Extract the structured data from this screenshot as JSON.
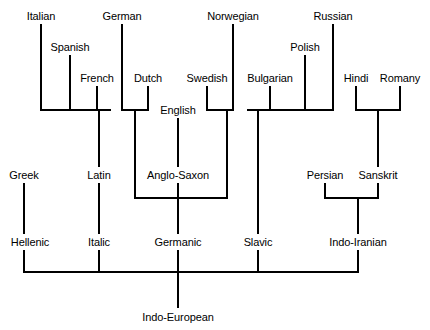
{
  "figure": {
    "background_color": "#ffffff",
    "line_color": "#000000",
    "text_color": "#000000",
    "width": 430,
    "height": 330
  },
  "nodes": [
    {
      "id": "italian",
      "label": "Italian",
      "x": 41,
      "y": 16,
      "level": "language"
    },
    {
      "id": "spanish",
      "label": "Spanish",
      "x": 70,
      "y": 47,
      "level": "language"
    },
    {
      "id": "french",
      "label": "French",
      "x": 97,
      "y": 78,
      "level": "language"
    },
    {
      "id": "german",
      "label": "German",
      "x": 122,
      "y": 16,
      "level": "language"
    },
    {
      "id": "dutch",
      "label": "Dutch",
      "x": 148,
      "y": 78,
      "level": "language"
    },
    {
      "id": "english",
      "label": "English",
      "x": 178,
      "y": 110,
      "level": "language"
    },
    {
      "id": "swedish",
      "label": "Swedish",
      "x": 207,
      "y": 78,
      "level": "language"
    },
    {
      "id": "norwegian",
      "label": "Norwegian",
      "x": 233,
      "y": 16,
      "level": "language"
    },
    {
      "id": "bulgarian",
      "label": "Bulgarian",
      "x": 270,
      "y": 78,
      "level": "language"
    },
    {
      "id": "polish",
      "label": "Polish",
      "x": 305,
      "y": 47,
      "level": "language"
    },
    {
      "id": "russian",
      "label": "Russian",
      "x": 333,
      "y": 16,
      "level": "language"
    },
    {
      "id": "hindi",
      "label": "Hindi",
      "x": 356,
      "y": 78,
      "level": "language"
    },
    {
      "id": "romany",
      "label": "Romany",
      "x": 400,
      "y": 78,
      "level": "language"
    },
    {
      "id": "greek",
      "label": "Greek",
      "x": 24,
      "y": 175,
      "level": "ancestor"
    },
    {
      "id": "latin",
      "label": "Latin",
      "x": 99,
      "y": 175,
      "level": "ancestor"
    },
    {
      "id": "anglo-saxon",
      "label": "Anglo-Saxon",
      "x": 178,
      "y": 175,
      "level": "ancestor"
    },
    {
      "id": "persian",
      "label": "Persian",
      "x": 325,
      "y": 175,
      "level": "ancestor"
    },
    {
      "id": "sanskrit",
      "label": "Sanskrit",
      "x": 378,
      "y": 175,
      "level": "ancestor"
    },
    {
      "id": "hellenic",
      "label": "Hellenic",
      "x": 30,
      "y": 242,
      "level": "branch"
    },
    {
      "id": "italic",
      "label": "Italic",
      "x": 99,
      "y": 242,
      "level": "branch"
    },
    {
      "id": "germanic",
      "label": "Germanic",
      "x": 178,
      "y": 242,
      "level": "branch"
    },
    {
      "id": "slavic",
      "label": "Slavic",
      "x": 258,
      "y": 242,
      "level": "branch"
    },
    {
      "id": "indo-iranian",
      "label": "Indo-Iranian",
      "x": 358,
      "y": 242,
      "level": "branch"
    },
    {
      "id": "indo-european",
      "label": "Indo-European",
      "x": 178,
      "y": 317,
      "level": "root"
    }
  ],
  "lines": [
    {
      "id": "italian-stem",
      "x1": 41,
      "y1": 24,
      "x2": 41,
      "y2": 110
    },
    {
      "id": "spanish-stem",
      "x1": 70,
      "y1": 55,
      "x2": 70,
      "y2": 110
    },
    {
      "id": "french-stem",
      "x1": 97,
      "y1": 86,
      "x2": 97,
      "y2": 110
    },
    {
      "id": "italic-crossbar",
      "x1": 40,
      "y1": 110,
      "x2": 111,
      "y2": 110
    },
    {
      "id": "italic-drop",
      "x1": 99,
      "y1": 110,
      "x2": 99,
      "y2": 167
    },
    {
      "id": "latin-to-italic",
      "x1": 99,
      "y1": 183,
      "x2": 99,
      "y2": 234
    },
    {
      "id": "italic-to-base",
      "x1": 99,
      "y1": 250,
      "x2": 99,
      "y2": 272
    },
    {
      "id": "german-stem",
      "x1": 122,
      "y1": 24,
      "x2": 122,
      "y2": 110
    },
    {
      "id": "dutch-stem",
      "x1": 148,
      "y1": 86,
      "x2": 148,
      "y2": 110
    },
    {
      "id": "german-dutch-bar",
      "x1": 121,
      "y1": 110,
      "x2": 149,
      "y2": 110
    },
    {
      "id": "german-dutch-drop",
      "x1": 135,
      "y1": 110,
      "x2": 135,
      "y2": 198
    },
    {
      "id": "english-stem",
      "x1": 178,
      "y1": 118,
      "x2": 178,
      "y2": 167
    },
    {
      "id": "anglo-saxon-drop",
      "x1": 178,
      "y1": 183,
      "x2": 178,
      "y2": 234
    },
    {
      "id": "swedish-stem",
      "x1": 207,
      "y1": 86,
      "x2": 207,
      "y2": 110
    },
    {
      "id": "norwegian-stem",
      "x1": 233,
      "y1": 24,
      "x2": 233,
      "y2": 110
    },
    {
      "id": "nordic-bar",
      "x1": 206,
      "y1": 110,
      "x2": 234,
      "y2": 110
    },
    {
      "id": "nordic-drop",
      "x1": 227,
      "y1": 110,
      "x2": 227,
      "y2": 198
    },
    {
      "id": "germanic-bar",
      "x1": 134,
      "y1": 198,
      "x2": 228,
      "y2": 198
    },
    {
      "id": "germanic-drop",
      "x1": 178,
      "y1": 198,
      "x2": 178,
      "y2": 234
    },
    {
      "id": "germanic-to-base",
      "x1": 178,
      "y1": 250,
      "x2": 178,
      "y2": 272
    },
    {
      "id": "greek-stem",
      "x1": 24,
      "y1": 183,
      "x2": 24,
      "y2": 234
    },
    {
      "id": "hellenic-to-base",
      "x1": 24,
      "y1": 250,
      "x2": 24,
      "y2": 272
    },
    {
      "id": "bulgarian-stem",
      "x1": 270,
      "y1": 86,
      "x2": 270,
      "y2": 110
    },
    {
      "id": "polish-stem",
      "x1": 305,
      "y1": 55,
      "x2": 305,
      "y2": 110
    },
    {
      "id": "russian-stem",
      "x1": 333,
      "y1": 24,
      "x2": 333,
      "y2": 110
    },
    {
      "id": "slavic-bar",
      "x1": 247,
      "y1": 110,
      "x2": 334,
      "y2": 110
    },
    {
      "id": "slavic-drop",
      "x1": 258,
      "y1": 110,
      "x2": 258,
      "y2": 234
    },
    {
      "id": "slavic-to-base",
      "x1": 258,
      "y1": 250,
      "x2": 258,
      "y2": 272
    },
    {
      "id": "hindi-stem",
      "x1": 356,
      "y1": 86,
      "x2": 356,
      "y2": 110
    },
    {
      "id": "romany-stem",
      "x1": 400,
      "y1": 86,
      "x2": 400,
      "y2": 110
    },
    {
      "id": "indic-bar",
      "x1": 355,
      "y1": 110,
      "x2": 401,
      "y2": 110
    },
    {
      "id": "indic-drop",
      "x1": 378,
      "y1": 110,
      "x2": 378,
      "y2": 167
    },
    {
      "id": "persian-stem",
      "x1": 325,
      "y1": 183,
      "x2": 325,
      "y2": 198
    },
    {
      "id": "sanskrit-stem",
      "x1": 378,
      "y1": 183,
      "x2": 378,
      "y2": 198
    },
    {
      "id": "indo-iranian-bar",
      "x1": 324,
      "y1": 198,
      "x2": 379,
      "y2": 198
    },
    {
      "id": "indo-iranian-drop",
      "x1": 358,
      "y1": 198,
      "x2": 358,
      "y2": 234
    },
    {
      "id": "indo-iranian-base",
      "x1": 358,
      "y1": 250,
      "x2": 358,
      "y2": 272
    },
    {
      "id": "root-crossbar",
      "x1": 23,
      "y1": 272,
      "x2": 359,
      "y2": 272
    },
    {
      "id": "indo-european-drop",
      "x1": 178,
      "y1": 272,
      "x2": 178,
      "y2": 308
    }
  ],
  "edges": [
    {
      "from": "italian",
      "to": "italic"
    },
    {
      "from": "spanish",
      "to": "italic"
    },
    {
      "from": "french",
      "to": "italic"
    },
    {
      "from": "latin",
      "to": "italic"
    },
    {
      "from": "german",
      "to": "germanic"
    },
    {
      "from": "dutch",
      "to": "germanic"
    },
    {
      "from": "english",
      "to": "anglo-saxon"
    },
    {
      "from": "anglo-saxon",
      "to": "germanic"
    },
    {
      "from": "swedish",
      "to": "germanic"
    },
    {
      "from": "norwegian",
      "to": "germanic"
    },
    {
      "from": "greek",
      "to": "hellenic"
    },
    {
      "from": "bulgarian",
      "to": "slavic"
    },
    {
      "from": "polish",
      "to": "slavic"
    },
    {
      "from": "russian",
      "to": "slavic"
    },
    {
      "from": "hindi",
      "to": "sanskrit"
    },
    {
      "from": "romany",
      "to": "sanskrit"
    },
    {
      "from": "persian",
      "to": "indo-iranian"
    },
    {
      "from": "sanskrit",
      "to": "indo-iranian"
    },
    {
      "from": "hellenic",
      "to": "indo-european"
    },
    {
      "from": "italic",
      "to": "indo-european"
    },
    {
      "from": "germanic",
      "to": "indo-european"
    },
    {
      "from": "slavic",
      "to": "indo-european"
    },
    {
      "from": "indo-iranian",
      "to": "indo-european"
    }
  ]
}
